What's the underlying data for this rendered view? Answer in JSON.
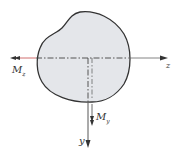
{
  "diagram": {
    "colors": {
      "section_fill": "#e4e6ea",
      "outline": "#333333",
      "axis": "#444444",
      "moment_z_line": "#c44a4a"
    },
    "labels": {
      "mz_main": "M",
      "mz_sub": "z",
      "my_main": "M",
      "my_sub": "y",
      "z_axis": "z",
      "y_axis": "y"
    }
  }
}
